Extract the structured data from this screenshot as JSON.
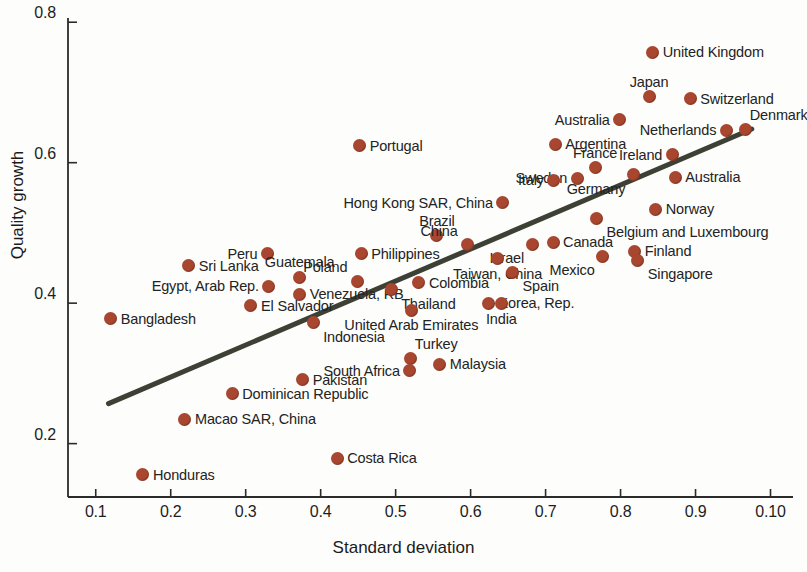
{
  "chart_data": {
    "type": "scatter",
    "title": "",
    "xlabel": "Standard deviation",
    "ylabel": "Quality growth",
    "xticks": [
      "0.1",
      "0.2",
      "0.3",
      "0.4",
      "0.5",
      "0.6",
      "0.7",
      "0.8",
      "0.9",
      "0.10"
    ],
    "xtick_values": [
      0.1,
      0.2,
      0.3,
      0.4,
      0.5,
      0.6,
      0.7,
      0.8,
      0.9,
      1.0
    ],
    "yticks": [
      "0.2",
      "0.4",
      "0.6",
      "0.8"
    ],
    "ytick_values": [
      0.2,
      0.4,
      0.6,
      0.8
    ],
    "xlim": [
      0.063,
      1.03
    ],
    "ylim": [
      0.124,
      0.806
    ],
    "grid": false,
    "legend": null,
    "marker_color": "#a8462f",
    "trendline_color": "#3d4034",
    "trendline": {
      "x0": 0.117,
      "y0": 0.257,
      "x1": 0.975,
      "y1": 0.648
    },
    "points": [
      {
        "label": "United Kingdom",
        "x": 0.843,
        "y": 0.757,
        "side": "r"
      },
      {
        "label": "Japan",
        "x": 0.838,
        "y": 0.694,
        "side": "c-above"
      },
      {
        "label": "Switzerland",
        "x": 0.893,
        "y": 0.691,
        "side": "r"
      },
      {
        "label": "Australia",
        "x": 0.799,
        "y": 0.661,
        "side": "l"
      },
      {
        "label": "Netherlands",
        "x": 0.941,
        "y": 0.646,
        "side": "l"
      },
      {
        "label": "Denmark",
        "x": 0.967,
        "y": 0.647,
        "side": "r-above"
      },
      {
        "label": "Argentina",
        "x": 0.713,
        "y": 0.626,
        "side": "r"
      },
      {
        "label": "Portugal",
        "x": 0.452,
        "y": 0.624,
        "side": "r"
      },
      {
        "label": "Ireland",
        "x": 0.869,
        "y": 0.611,
        "side": "l"
      },
      {
        "label": "France",
        "x": 0.766,
        "y": 0.593,
        "side": "c-above"
      },
      {
        "label": "Sweden",
        "x": 0.742,
        "y": 0.578,
        "side": "l"
      },
      {
        "label": "Italy",
        "x": 0.711,
        "y": 0.575,
        "side": "l"
      },
      {
        "label": "Germany",
        "x": 0.817,
        "y": 0.583,
        "side": "l-below"
      },
      {
        "label": "Australia",
        "x": 0.873,
        "y": 0.579,
        "side": "r"
      },
      {
        "label": "Hong Kong SAR, China",
        "x": 0.643,
        "y": 0.543,
        "side": "l"
      },
      {
        "label": "Norway",
        "x": 0.847,
        "y": 0.534,
        "side": "r"
      },
      {
        "label": "Belgium and Luxembourg",
        "x": 0.768,
        "y": 0.521,
        "side": "r-below"
      },
      {
        "label": "Brazil",
        "x": 0.555,
        "y": 0.496,
        "side": "c-above"
      },
      {
        "label": "China",
        "x": 0.596,
        "y": 0.483,
        "side": "l-above"
      },
      {
        "label": "Canada",
        "x": 0.71,
        "y": 0.487,
        "side": "r"
      },
      {
        "label": "Mexico",
        "x": 0.776,
        "y": 0.467,
        "side": "l-below"
      },
      {
        "label": "Finland",
        "x": 0.819,
        "y": 0.474,
        "side": "r"
      },
      {
        "label": "Singapore",
        "x": 0.823,
        "y": 0.461,
        "side": "r-below"
      },
      {
        "label": "Peru",
        "x": 0.329,
        "y": 0.47,
        "side": "l"
      },
      {
        "label": "Philippines",
        "x": 0.454,
        "y": 0.47,
        "side": "r"
      },
      {
        "label": "Israel",
        "x": 0.682,
        "y": 0.484,
        "side": "l-below"
      },
      {
        "label": "Taiwan, China",
        "x": 0.636,
        "y": 0.463,
        "side": "c-below"
      },
      {
        "label": "Sri Lanka",
        "x": 0.224,
        "y": 0.453,
        "side": "r"
      },
      {
        "label": "Guatemala",
        "x": 0.372,
        "y": 0.437,
        "side": "c-above"
      },
      {
        "label": "Poland",
        "x": 0.449,
        "y": 0.431,
        "side": "l-above"
      },
      {
        "label": "Egypt, Arab Rep.",
        "x": 0.331,
        "y": 0.424,
        "side": "l"
      },
      {
        "label": "Venezuela, RB",
        "x": 0.372,
        "y": 0.413,
        "side": "r"
      },
      {
        "label": "Thailand",
        "x": 0.494,
        "y": 0.419,
        "side": "r-below"
      },
      {
        "label": "Colombia",
        "x": 0.531,
        "y": 0.429,
        "side": "r"
      },
      {
        "label": "Spain",
        "x": 0.656,
        "y": 0.444,
        "side": "r-below"
      },
      {
        "label": "El Salvador",
        "x": 0.307,
        "y": 0.396,
        "side": "r"
      },
      {
        "label": "Korea, Rep.",
        "x": 0.624,
        "y": 0.4,
        "side": "r"
      },
      {
        "label": "India",
        "x": 0.641,
        "y": 0.399,
        "side": "c-below"
      },
      {
        "label": "Indonesia",
        "x": 0.39,
        "y": 0.372,
        "side": "r-below"
      },
      {
        "label": "United Arab Emirates",
        "x": 0.521,
        "y": 0.39,
        "side": "c-below"
      },
      {
        "label": "Bangladesh",
        "x": 0.12,
        "y": 0.378,
        "side": "r"
      },
      {
        "label": "Turkey",
        "x": 0.52,
        "y": 0.321,
        "side": "r-above"
      },
      {
        "label": "South Africa",
        "x": 0.519,
        "y": 0.304,
        "side": "l"
      },
      {
        "label": "Malaysia",
        "x": 0.559,
        "y": 0.313,
        "side": "r"
      },
      {
        "label": "Pakistan",
        "x": 0.376,
        "y": 0.291,
        "side": "r"
      },
      {
        "label": "Dominican Republic",
        "x": 0.282,
        "y": 0.271,
        "side": "r"
      },
      {
        "label": "Macao SAR, China",
        "x": 0.219,
        "y": 0.235,
        "side": "r"
      },
      {
        "label": "Costa Rica",
        "x": 0.422,
        "y": 0.179,
        "side": "r"
      },
      {
        "label": "Honduras",
        "x": 0.163,
        "y": 0.156,
        "side": "r"
      }
    ]
  }
}
